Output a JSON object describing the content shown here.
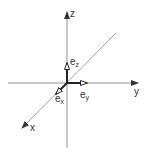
{
  "diagram": {
    "title": "",
    "axes": {
      "x": {
        "label": "x"
      },
      "y": {
        "label": "y"
      },
      "z": {
        "label": "z"
      }
    },
    "unit_vectors": [
      {
        "base": "e",
        "sub": "x"
      },
      {
        "base": "e",
        "sub": "y"
      },
      {
        "base": "e",
        "sub": "z"
      }
    ],
    "colors": {
      "axis": "#666666",
      "vector": "#222222",
      "text": "#333333"
    }
  }
}
